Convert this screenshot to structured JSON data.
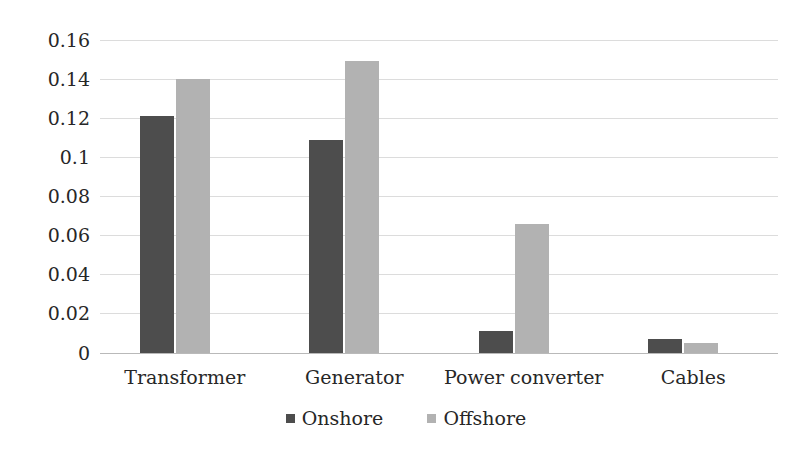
{
  "chart_data": {
    "type": "bar",
    "title": "",
    "subtitle": "",
    "xlabel": "",
    "ylabel": "",
    "categories": [
      "Transformer",
      "Generator",
      "Power converter",
      "Cables"
    ],
    "series": [
      {
        "name": "Onshore",
        "color": "#4d4d4d",
        "values": [
          0.121,
          0.109,
          0.011,
          0.007
        ]
      },
      {
        "name": "Offshore",
        "color": "#b2b2b2",
        "values": [
          0.14,
          0.149,
          0.066,
          0.005
        ]
      }
    ],
    "ylim": [
      0,
      0.16
    ],
    "ytick_step": 0.02,
    "ytick_labels": [
      "0.16",
      "0.14",
      "0.12",
      "0.1",
      "0.08",
      "0.06",
      "0.04",
      "0.02",
      "0"
    ],
    "ytick_values": [
      0.16,
      0.14,
      0.12,
      0.1,
      0.08,
      0.06,
      0.04,
      0.02,
      0
    ],
    "grid": true,
    "grid_axis": "y",
    "legend_position": "bottom",
    "annotations": []
  },
  "legend": {
    "items": [
      {
        "label": "Onshore",
        "swatch": "onshore-legend-swatch"
      },
      {
        "label": "Offshore",
        "swatch": "offshore-legend-swatch"
      }
    ]
  }
}
